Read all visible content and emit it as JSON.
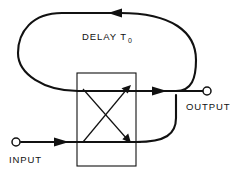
{
  "figure": {
    "type": "signal-flow-block-diagram",
    "background_color": "#ffffff",
    "line_color": "#111111",
    "labels": {
      "delay": "DELAY T",
      "delay_subscript": "0",
      "input": "INPUT",
      "output": "OUTPUT"
    },
    "terminals": [
      {
        "name": "input",
        "label": "INPUT",
        "x": 16,
        "y": 142,
        "radius": 4
      },
      {
        "name": "output",
        "label": "OUTPUT",
        "x": 207,
        "y": 91,
        "radius": 4
      }
    ],
    "block": {
      "name": "coupler",
      "x": 77,
      "y": 73,
      "width": 59,
      "height": 93
    },
    "paths": {
      "input_line": "M 22 142 L 136 142",
      "output_line": "M 77 91 L 203 91",
      "feedback_loop": "M 166 91 C 186 91 190 72 190 56 C 190 30 168 12 118 12 L 60 12 C 30 12 20 30 20 52 C 20 74 42 91 77 91",
      "return_loop": "M 136 142 C 170 142 176 132 176 120 C 176 108 176 100 176 91",
      "diagonal_up": "M 84 142 L 130 86",
      "diagonal_down": "M 84 86 L 130 142"
    },
    "arrows": [
      {
        "name": "input-arrow",
        "x": 62,
        "y": 142,
        "direction": "right"
      },
      {
        "name": "output-arrow",
        "x": 160,
        "y": 91,
        "direction": "right"
      },
      {
        "name": "feedback-arrow",
        "x": 118,
        "y": 12,
        "direction": "left"
      },
      {
        "name": "coupler-arrow-up",
        "x": 130,
        "y": 86,
        "direction": "up-right"
      },
      {
        "name": "coupler-arrow-down",
        "x": 130,
        "y": 142,
        "direction": "down-right"
      }
    ]
  }
}
